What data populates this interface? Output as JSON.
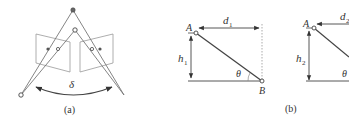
{
  "panel_a": {
    "caption": "(a)",
    "angle_label": "δ"
  },
  "panel_b": {
    "caption": "(b)",
    "left": {
      "point_top": "A",
      "point_bottom": "B",
      "distance": "d",
      "distance_sub": "1",
      "height": "h",
      "height_sub": "1",
      "angle": "θ"
    },
    "right": {
      "point_top": "A",
      "distance": "d",
      "distance_sub": "2",
      "height": "h",
      "height_sub": "2",
      "angle": "θ"
    }
  },
  "colors": {
    "stroke": "#555555",
    "light_stroke": "#999999",
    "text": "#333333"
  }
}
